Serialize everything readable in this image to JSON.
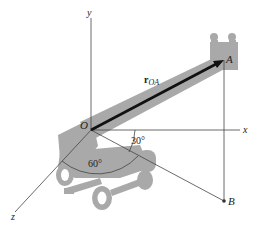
{
  "figure": {
    "axes": {
      "x": "x",
      "y": "y",
      "z": "z"
    },
    "points": {
      "origin": "O",
      "A": "A",
      "B": "B"
    },
    "vector": {
      "symbol": "r",
      "subscript": "OA"
    },
    "angles": {
      "alpha": "30°",
      "beta": "60°"
    },
    "colors": {
      "machine": "#a9a9a9",
      "axis": "#444444",
      "vector": "#111111",
      "arc": "#555555"
    }
  }
}
